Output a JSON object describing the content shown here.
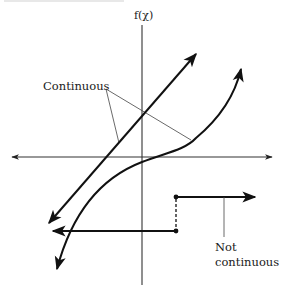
{
  "diagram": {
    "y_axis_label": "f(χ)",
    "labels": {
      "continuous": "Continuous",
      "not_continuous_line1": "Not",
      "not_continuous_line2": "continuous"
    },
    "colors": {
      "stroke": "#111111",
      "axis": "#333333",
      "leader": "#444444",
      "background": "#ffffff"
    },
    "elements": [
      {
        "name": "x-axis",
        "type": "double-arrow-line",
        "from": [
          10,
          157
        ],
        "to": [
          272,
          157
        ]
      },
      {
        "name": "y-axis",
        "type": "line",
        "from": [
          142,
          25
        ],
        "to": [
          142,
          285
        ]
      },
      {
        "name": "straight-line-function",
        "type": "double-arrow-line",
        "from": [
          48,
          224
        ],
        "to": [
          197,
          53
        ],
        "continuous": true
      },
      {
        "name": "cubic-curve-function",
        "type": "double-arrow-curve",
        "from": [
          57,
          270
        ],
        "to": [
          241,
          68
        ],
        "continuous": true
      },
      {
        "name": "step-function-lower",
        "type": "arrow-line",
        "from": [
          176,
          231
        ],
        "to": [
          52,
          231
        ],
        "continuous": false
      },
      {
        "name": "step-function-upper",
        "type": "arrow-line",
        "from": [
          176,
          197
        ],
        "to": [
          256,
          197
        ],
        "continuous": false
      },
      {
        "name": "step-jump",
        "type": "dashed-line",
        "from": [
          176,
          197
        ],
        "to": [
          176,
          231
        ]
      }
    ]
  }
}
